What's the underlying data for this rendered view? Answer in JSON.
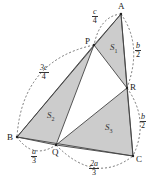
{
  "colors": {
    "fill": "#cccccc",
    "stroke": "#444444",
    "dash": "#555555"
  },
  "vertices": {
    "A": {
      "label": "A",
      "x": 121,
      "y": 14
    },
    "P": {
      "label": "P",
      "x": 94,
      "y": 45
    },
    "R": {
      "label": "R",
      "x": 127,
      "y": 88
    },
    "B": {
      "label": "B",
      "x": 17,
      "y": 137
    },
    "Q": {
      "label": "Q",
      "x": 56,
      "y": 145
    },
    "C": {
      "label": "C",
      "x": 133,
      "y": 156
    }
  },
  "regions": {
    "S1": {
      "letter": "S",
      "sub": "1"
    },
    "S2": {
      "letter": "S",
      "sub": "2"
    },
    "S3": {
      "letter": "S",
      "sub": "3"
    }
  },
  "segments": {
    "AP": {
      "num": "c",
      "den": "4"
    },
    "PB": {
      "num": "3c",
      "den": "4"
    },
    "AR": {
      "num": "b",
      "den": "2"
    },
    "RC": {
      "num": "b",
      "den": "2"
    },
    "BQ": {
      "num": "a",
      "den": "3"
    },
    "QC": {
      "num": "2a",
      "den": "3"
    }
  }
}
